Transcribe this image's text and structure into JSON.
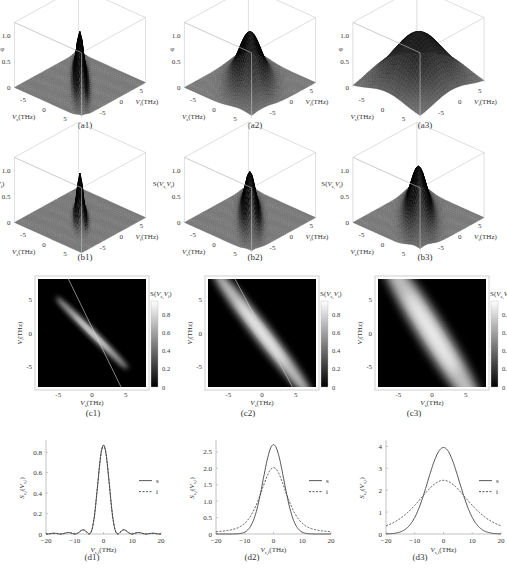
{
  "figure": {
    "rows": [
      "a",
      "b",
      "c",
      "d"
    ],
    "columns": 3
  },
  "chart_data": [
    {
      "id": "a1",
      "type": "surface3d",
      "caption": "(a1)",
      "zlabel": "φ",
      "xlabel": "V_s(THz)",
      "ylabel": "V_i(THz)",
      "zticks": [
        "0",
        "0.5",
        "1.0"
      ],
      "xticks": [
        "-5",
        "0",
        "5"
      ],
      "yticks": [
        "5",
        "0",
        "-5"
      ],
      "shape": "narrow ridge along anti-diagonal",
      "peak": 1.0,
      "width": 0.6,
      "ridge_len": 9
    },
    {
      "id": "a2",
      "type": "surface3d",
      "caption": "(a2)",
      "zlabel": "φ",
      "xlabel": "V_s(THz)",
      "ylabel": "V_i(THz)",
      "zticks": [
        "0",
        "0.5",
        "1.0"
      ],
      "xticks": [
        "-5",
        "0",
        "5"
      ],
      "yticks": [
        "5",
        "0",
        "-5"
      ],
      "shape": "medium ridge along anti-diagonal",
      "peak": 1.0,
      "width": 2.0,
      "ridge_len": 9
    },
    {
      "id": "a3",
      "type": "surface3d",
      "caption": "(a3)",
      "zlabel": "φ",
      "xlabel": "V_s(THz)",
      "ylabel": "V_i(THz)",
      "zticks": [
        "0",
        "0.5",
        "1.0"
      ],
      "xticks": [
        "-5",
        "0",
        "5"
      ],
      "yticks": [
        "5",
        "0",
        "-5"
      ],
      "shape": "broad hump along anti-diagonal",
      "peak": 1.0,
      "width": 4.5,
      "ridge_len": 9
    },
    {
      "id": "b1",
      "type": "surface3d",
      "caption": "(b1)",
      "zlabel": "S(V_s,V_i)",
      "xlabel": "V_s(THz)",
      "ylabel": "V_i(THz)",
      "zticks": [
        "0",
        "0.5",
        "1.0"
      ],
      "xticks": [
        "-5",
        "0",
        "5"
      ],
      "yticks": [
        "5",
        "0",
        "-5"
      ],
      "shape": "thin localized peak",
      "peak": 0.9,
      "width": 0.5,
      "ridge_len": 5
    },
    {
      "id": "b2",
      "type": "surface3d",
      "caption": "(b2)",
      "zlabel": "S(V_s,V_i)",
      "xlabel": "V_s(THz)",
      "ylabel": "V_i(THz)",
      "zticks": [
        "0",
        "0.5",
        "1.0"
      ],
      "xticks": [
        "-5",
        "0",
        "5"
      ],
      "yticks": [
        "5",
        "0",
        "-5"
      ],
      "shape": "elongated ridge",
      "peak": 0.9,
      "width": 0.9,
      "ridge_len": 9
    },
    {
      "id": "b3",
      "type": "surface3d",
      "caption": "(b3)",
      "zlabel": "S(V_s,V_i)",
      "xlabel": "V_s(THz)",
      "ylabel": "V_i(THz)",
      "zticks": [
        "0",
        "0.5",
        "1.0"
      ],
      "xticks": [
        "-5",
        "0",
        "5"
      ],
      "yticks": [
        "5",
        "0",
        "-5"
      ],
      "shape": "elongated ridge with larger height",
      "peak": 1.0,
      "width": 1.4,
      "ridge_len": 10
    },
    {
      "id": "c1",
      "type": "heatmap",
      "caption": "(c1)",
      "xlabel": "V_s(THz)",
      "ylabel": "V_i(THz)",
      "colorbar_label": "S(V_s,V_i)",
      "xticks": [
        -5,
        0,
        5
      ],
      "yticks": [
        -5,
        0,
        5
      ],
      "xlim": [
        -8,
        8
      ],
      "ylim": [
        -8,
        8
      ],
      "colorbar_ticks": [
        0,
        0.2,
        0.4,
        0.6,
        0.8
      ],
      "band": {
        "slope": -1.0,
        "width": 0.6,
        "length": 7.5
      },
      "guide_line": {
        "x0": -3.5,
        "y0": 8,
        "x1": 4.3,
        "y1": -8
      }
    },
    {
      "id": "c2",
      "type": "heatmap",
      "caption": "(c2)",
      "xlabel": "V_s(THz)",
      "ylabel": "V_i(THz)",
      "colorbar_label": "S(V_s,V_i)",
      "xticks": [
        -5,
        0,
        5
      ],
      "yticks": [
        -5,
        0,
        5
      ],
      "xlim": [
        -8,
        8
      ],
      "ylim": [
        -8,
        8
      ],
      "colorbar_ticks": [
        0,
        0.2,
        0.4,
        0.6,
        0.8
      ],
      "band": {
        "slope": -1.3,
        "width": 1.4,
        "length": 12
      },
      "guide_line": {
        "x0": -4.0,
        "y0": 8,
        "x1": 4.5,
        "y1": -8
      }
    },
    {
      "id": "c3",
      "type": "heatmap",
      "caption": "(c3)",
      "xlabel": "V_s(THz)",
      "ylabel": "V_i(THz)",
      "colorbar_label": "S(V_s,V_i)",
      "xticks": [
        -5,
        0,
        5
      ],
      "yticks": [
        -5,
        0,
        5
      ],
      "xlim": [
        -8,
        8
      ],
      "ylim": [
        -8,
        8
      ],
      "colorbar_ticks": [
        0,
        0.2,
        0.4,
        0.6,
        0.8
      ],
      "band": {
        "slope": -1.6,
        "width": 2.2,
        "length": 14
      },
      "guide_line": null
    },
    {
      "id": "d1",
      "type": "line",
      "caption": "(d1)",
      "xlabel": "V_s,i(THz)",
      "ylabel": "S_s,i(V_s,i)",
      "xlim": [
        -20,
        20
      ],
      "ylim": [
        0,
        0.9
      ],
      "xticks": [
        -20,
        -10,
        0,
        10,
        20
      ],
      "yticks": [
        0,
        0.2,
        0.4,
        0.6,
        0.8
      ],
      "legend": [
        "s",
        "i"
      ],
      "series": [
        {
          "name": "s",
          "style": "solid",
          "peak": 0.87,
          "sigma": 2.2,
          "sidelobes": true
        },
        {
          "name": "i",
          "style": "dashed",
          "peak": 0.87,
          "sigma": 2.2,
          "sidelobes": true
        }
      ]
    },
    {
      "id": "d2",
      "type": "line",
      "caption": "(d2)",
      "xlabel": "V_s,i(THz)",
      "ylabel": "S_s,i(V_s,i)",
      "xlim": [
        -20,
        20
      ],
      "ylim": [
        0,
        2.8
      ],
      "xticks": [
        -20,
        -10,
        0,
        10,
        20
      ],
      "yticks": [
        0,
        0.5,
        1.0,
        1.5,
        2.0,
        2.5
      ],
      "legend": [
        "s",
        "i"
      ],
      "series": [
        {
          "name": "s",
          "style": "solid",
          "peak": 2.72,
          "sigma": 3.6,
          "sidelobes": false
        },
        {
          "name": "i",
          "style": "dashed",
          "peak": 2.02,
          "sigma": 4.6,
          "sidelobes": false
        }
      ]
    },
    {
      "id": "d3",
      "type": "line",
      "caption": "(d3)",
      "xlabel": "V_s,i(THz)",
      "ylabel": "S_s,i(V_s,i)",
      "xlim": [
        -20,
        20
      ],
      "ylim": [
        0,
        4.2
      ],
      "xticks": [
        -20,
        -10,
        0,
        10,
        20
      ],
      "yticks": [
        0,
        1,
        2,
        3,
        4
      ],
      "legend": [
        "s",
        "i"
      ],
      "series": [
        {
          "name": "s",
          "style": "solid",
          "peak": 3.95,
          "sigma": 5.5,
          "sidelobes": false
        },
        {
          "name": "i",
          "style": "dashed",
          "peak": 2.45,
          "sigma": 9.0,
          "sidelobes": false
        }
      ]
    }
  ]
}
